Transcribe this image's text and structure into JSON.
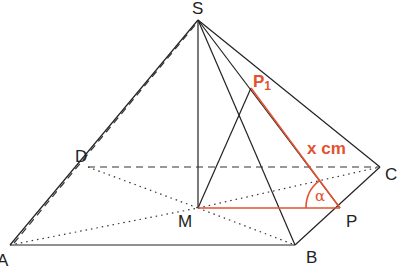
{
  "diagram": {
    "type": "square pyramid",
    "colors": {
      "line": "#222222",
      "accent": "#e2522f"
    },
    "vertices": {
      "S": {
        "label": "S",
        "x": 198,
        "y": 20
      },
      "A": {
        "label": "A",
        "x": 10,
        "y": 245
      },
      "B": {
        "label": "B",
        "x": 295,
        "y": 245
      },
      "C": {
        "label": "C",
        "x": 380,
        "y": 167
      },
      "D": {
        "label": "D",
        "x": 88,
        "y": 167
      },
      "M": {
        "label": "M",
        "x": 198,
        "y": 208
      },
      "P": {
        "label": "P",
        "x": 340,
        "y": 208
      },
      "P1": {
        "label": "P",
        "sub": "1",
        "x": 251,
        "y": 88
      }
    },
    "annotations": {
      "length_label": "x cm",
      "angle_label": "α"
    }
  }
}
